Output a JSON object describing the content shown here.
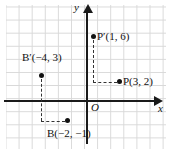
{
  "figure": {
    "type": "coordinate-plane-diagram",
    "grid": {
      "visible": true,
      "color": "#d8d8d8",
      "spacing_px": 13
    },
    "axes": {
      "x_label": "x",
      "y_label": "y",
      "origin_label": "O",
      "color": "#1a1a1a",
      "arrowheads": [
        "x-positive",
        "y-positive"
      ]
    },
    "points": [
      {
        "id": "P",
        "label": "P(3, 2)",
        "x": 3,
        "y": 2,
        "marker": "filled-dot",
        "color": "#111111"
      },
      {
        "id": "P_prime",
        "label": "P′(1, 6)",
        "x": 1,
        "y": 6,
        "marker": "filled-dot",
        "color": "#111111"
      },
      {
        "id": "B",
        "label": "B(−2, −1)",
        "x": -2,
        "y": -1,
        "marker": "filled-dot",
        "color": "#111111"
      },
      {
        "id": "B_prime",
        "label": "B′(−4, 3)",
        "x": -4,
        "y": 3,
        "marker": "filled-dot",
        "color": "#111111"
      }
    ],
    "connectors": [
      {
        "from": "P",
        "to": "P_prime",
        "style": "dashed",
        "shape": "elbow",
        "color": "#333333"
      },
      {
        "from": "B",
        "to": "B_prime",
        "style": "dashed",
        "shape": "elbow",
        "color": "#333333"
      }
    ]
  },
  "labels": {
    "p": "P(3, 2)",
    "p_prime": "P′(1, 6)",
    "b": "B(−2, −1)",
    "b_prime": "B′(−4, 3)",
    "x_axis": "x",
    "y_axis": "y",
    "origin": "O"
  }
}
